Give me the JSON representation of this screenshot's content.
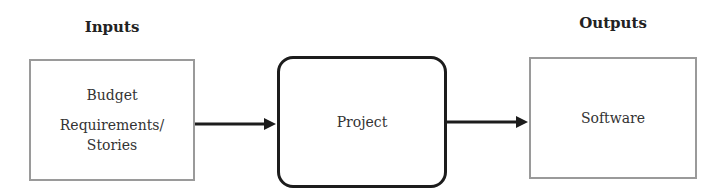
{
  "diagram": {
    "headings": {
      "inputs": "Inputs",
      "outputs": "Outputs"
    },
    "inputs_box": {
      "lines": [
        "Budget",
        "Requirements/",
        "Stories"
      ]
    },
    "project_box": {
      "label": "Project"
    },
    "outputs_box": {
      "label": "Software"
    },
    "edges": [
      {
        "from": "inputs_box",
        "to": "project_box"
      },
      {
        "from": "project_box",
        "to": "outputs_box"
      }
    ],
    "colors": {
      "thin_border": "#9a9a9a",
      "thick_border": "#1c1c1c",
      "arrow": "#1c1c1c"
    }
  }
}
